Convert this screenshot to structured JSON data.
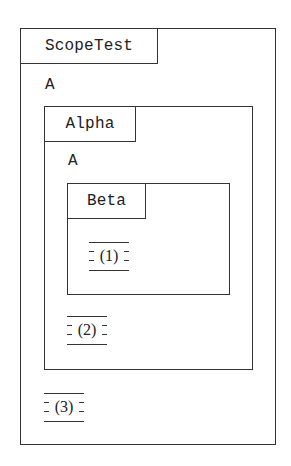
{
  "diagram": {
    "outer_scope": {
      "title": "ScopeTest",
      "declaration": "A",
      "placeholder": "(3)"
    },
    "middle_scope": {
      "title": "Alpha",
      "declaration": "A",
      "placeholder": "(2)"
    },
    "inner_scope": {
      "title": "Beta",
      "placeholder": "(1)"
    }
  },
  "colors": {
    "stroke": "#333333",
    "background": "#ffffff"
  }
}
